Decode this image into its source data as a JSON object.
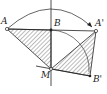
{
  "diagram": {
    "type": "geometry-rotation",
    "colors": {
      "stroke": "#222222",
      "hatch": "#555555",
      "background": "#ffffff"
    },
    "points": {
      "A": {
        "label": "A",
        "x": 7,
        "y": 29
      },
      "B": {
        "label": "B",
        "x": 51,
        "y": 30
      },
      "A1": {
        "label": "A'",
        "x": 96,
        "y": 31
      },
      "M": {
        "label": "M",
        "x": 51,
        "y": 69
      },
      "B1": {
        "label": "B'",
        "x": 90,
        "y": 76
      }
    },
    "shaded_triangles": [
      [
        "A",
        "B",
        "M"
      ],
      [
        "A'",
        "B'",
        "M"
      ]
    ],
    "arcs": [
      {
        "from": "A",
        "to": "A'",
        "arrow": true
      },
      {
        "from": "B",
        "to": "B'",
        "center": "M"
      }
    ],
    "axis": "vertical line through B and M"
  }
}
